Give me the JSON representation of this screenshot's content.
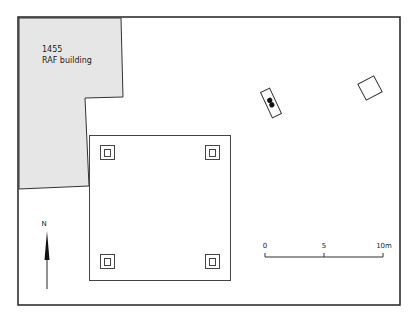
{
  "building": {
    "number": "1455",
    "name": "RAF building",
    "fill": "#e6e6e6"
  },
  "north_arrow": {
    "label": "N"
  },
  "scale_bar": {
    "ticks": [
      "0",
      "5",
      "10m"
    ]
  },
  "features": {
    "main_square": "square-structure",
    "post_pads": [
      "nw",
      "ne",
      "sw",
      "se"
    ],
    "small_rect_feature": "rotated-rect-with-dots",
    "rotated_square_feature": "rotated-square"
  },
  "colors": {
    "line": "#333333",
    "frame": "#222222",
    "building_fill": "#e6e6e6"
  }
}
